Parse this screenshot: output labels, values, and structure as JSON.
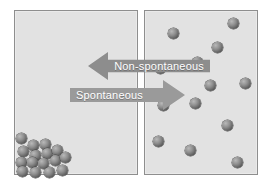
{
  "diagram": {
    "background_color": "#ffffff",
    "box_fill_color": "#e2e2e2",
    "box_border_color": "#8e8e8e",
    "particle_color": "#5e5e5e"
  },
  "boxes": [
    {
      "id": "left",
      "name": "left-container",
      "description": "Gas particles clustered in the bottom-left corner (ordered, low entropy)",
      "particle_count": 16
    },
    {
      "id": "right",
      "name": "right-container",
      "description": "Gas particles spread evenly throughout the container (disordered, high entropy)",
      "particle_count": 13
    }
  ],
  "arrows": [
    {
      "id": "non-spontaneous",
      "label": "Non-spontaneous",
      "direction": "left",
      "color": "#8d8d8d",
      "text_color": "#ffffff"
    },
    {
      "id": "spontaneous",
      "label": "Spontaneous",
      "direction": "right",
      "color": "#9a9a9a",
      "text_color": "#ffffff"
    }
  ],
  "particles_left": [
    {
      "x": 16,
      "y": 133
    },
    {
      "x": 28,
      "y": 140
    },
    {
      "x": 40,
      "y": 139
    },
    {
      "x": 18,
      "y": 146
    },
    {
      "x": 30,
      "y": 150
    },
    {
      "x": 42,
      "y": 148
    },
    {
      "x": 52,
      "y": 145
    },
    {
      "x": 16,
      "y": 157
    },
    {
      "x": 27,
      "y": 157
    },
    {
      "x": 38,
      "y": 158
    },
    {
      "x": 50,
      "y": 155
    },
    {
      "x": 60,
      "y": 152
    },
    {
      "x": 17,
      "y": 166
    },
    {
      "x": 30,
      "y": 167
    },
    {
      "x": 44,
      "y": 167
    },
    {
      "x": 57,
      "y": 165
    }
  ],
  "particles_right": [
    {
      "x": 228,
      "y": 18
    },
    {
      "x": 168,
      "y": 28
    },
    {
      "x": 212,
      "y": 42
    },
    {
      "x": 192,
      "y": 57
    },
    {
      "x": 155,
      "y": 63
    },
    {
      "x": 205,
      "y": 80
    },
    {
      "x": 240,
      "y": 78
    },
    {
      "x": 190,
      "y": 98
    },
    {
      "x": 158,
      "y": 100
    },
    {
      "x": 222,
      "y": 120
    },
    {
      "x": 153,
      "y": 136
    },
    {
      "x": 185,
      "y": 145
    },
    {
      "x": 232,
      "y": 157
    }
  ]
}
